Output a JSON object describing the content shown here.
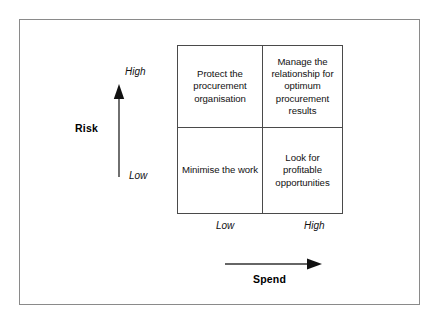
{
  "figure": {
    "type": "2x2-matrix",
    "colors": {
      "outer_border": "#8a8a8a",
      "matrix_border": "#4a4a4a",
      "text": "#111111",
      "background": "#ffffff"
    }
  },
  "y_axis": {
    "title": "Risk",
    "high_label": "High",
    "low_label": "Low",
    "arrow_direction": "up"
  },
  "x_axis": {
    "title": "Spend",
    "low_label": "Low",
    "high_label": "High",
    "arrow_direction": "right"
  },
  "matrix": {
    "cells": [
      {
        "position": "top-left",
        "risk": "High",
        "spend": "Low",
        "text": "Protect the procurement organisation"
      },
      {
        "position": "top-right",
        "risk": "High",
        "spend": "High",
        "text": "Manage the relationship for optimum procurement results"
      },
      {
        "position": "bottom-left",
        "risk": "Low",
        "spend": "Low",
        "text": "Minimise the work"
      },
      {
        "position": "bottom-right",
        "risk": "Low",
        "spend": "High",
        "text": "Look for profitable opportunities"
      }
    ]
  }
}
